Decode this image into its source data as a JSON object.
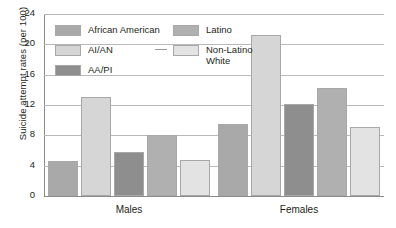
{
  "chart_data": {
    "type": "bar",
    "title": "",
    "subtitle": "",
    "xlabel": "",
    "ylabel": "Suicide attempt rates (per 100)",
    "categories": [
      "Males",
      "Females"
    ],
    "series": [
      {
        "name": "African American",
        "values": [
          4.6,
          9.5
        ],
        "color": "#a9a9a9"
      },
      {
        "name": "AI/AN",
        "values": [
          13.1,
          21.2
        ],
        "color": "#d6d6d6"
      },
      {
        "name": "AA/PI",
        "values": [
          5.8,
          12.1
        ],
        "color": "#8e8e8e"
      },
      {
        "name": "Latino",
        "values": [
          8.0,
          14.2
        ],
        "color": "#b0b0b0"
      },
      {
        "name": "Non-Latino White",
        "values": [
          4.7,
          9.1
        ],
        "color": "#e3e3e3"
      }
    ],
    "ylim": [
      0,
      24
    ],
    "yticks": [
      0,
      4,
      8,
      12,
      16,
      20,
      24
    ],
    "ytick_labels": [
      "0",
      "4",
      "8",
      "12",
      "16",
      "20",
      "24"
    ],
    "grid": true,
    "legend_position": "upper-left-inside"
  },
  "legend": {
    "column_a": [
      {
        "label": "African American",
        "label_line2": ""
      },
      {
        "label": "AI/AN",
        "label_line2": ""
      },
      {
        "label": "AA/PI",
        "label_line2": ""
      }
    ],
    "column_b": [
      {
        "label": "Latino",
        "label_line2": ""
      },
      {
        "label": "Non-Latino",
        "label_line2": "White"
      }
    ]
  },
  "axis": {
    "y_title": "Suicide attempt rates (per 100)",
    "y_ticks": [
      "0",
      "4",
      "8",
      "12",
      "16",
      "20",
      "24"
    ],
    "x_groups": [
      "Males",
      "Females"
    ]
  },
  "colors": {
    "african_american": "#a9a9a9",
    "ai_an": "#d6d6d6",
    "aa_pi": "#8e8e8e",
    "latino": "#b0b0b0",
    "non_latino_white": "#e3e3e3",
    "gridline": "#b9b9b9",
    "axis": "#8c8c8c",
    "text": "#231f20"
  }
}
